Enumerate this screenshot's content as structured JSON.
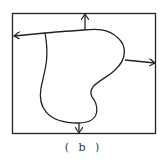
{
  "figure": {
    "caption": "( b )",
    "stroke_color": "#222222",
    "elements": [
      "outer-rectangle",
      "closed-region-curve",
      "arrow-up",
      "arrow-left",
      "arrow-right",
      "arrow-down"
    ]
  }
}
